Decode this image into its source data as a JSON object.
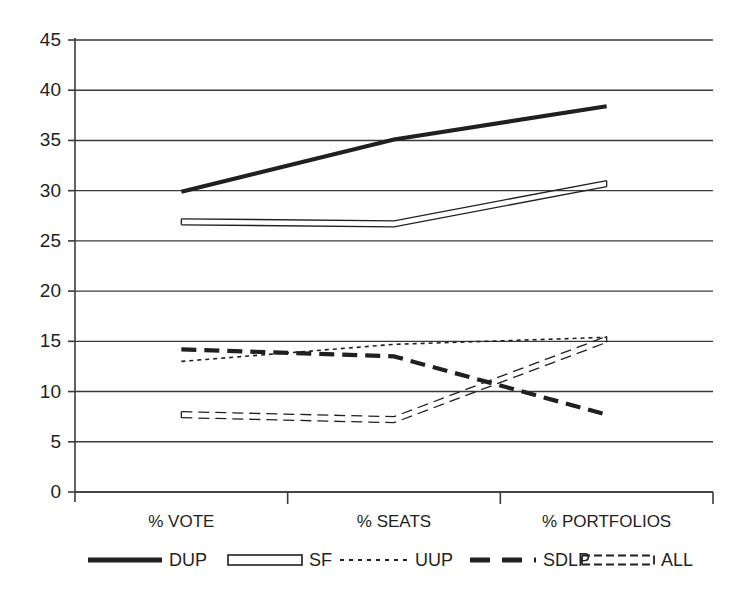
{
  "chart_data": {
    "type": "line",
    "title": "",
    "subtitle": "",
    "xlabel": "",
    "ylabel": "",
    "categories": [
      "% VOTE",
      "% SEATS",
      "% PORTFOLIOS"
    ],
    "ylim": [
      0,
      45
    ],
    "yticks": [
      0,
      5,
      10,
      15,
      20,
      25,
      30,
      35,
      40,
      45
    ],
    "ytick_labels": [
      "0",
      "5",
      "10",
      "15",
      "20",
      "25",
      "30",
      "35",
      "40",
      "45"
    ],
    "grid": "horizontal",
    "legend_position": "bottom",
    "series": [
      {
        "name": "DUP",
        "values": [
          29.9,
          35.1,
          38.4
        ],
        "style": "thick-solid",
        "color": "#231f20",
        "width": 4.2,
        "dash": "none"
      },
      {
        "name": "SF",
        "values": [
          26.9,
          26.7,
          30.7
        ],
        "style": "double-solid",
        "color": "#231f20",
        "width": 1.3,
        "dash": "none"
      },
      {
        "name": "UUP",
        "values": [
          13.0,
          14.7,
          15.4
        ],
        "style": "fine-dotted",
        "color": "#231f20",
        "width": 1.6,
        "dash": "4,4"
      },
      {
        "name": "SDLP",
        "values": [
          14.2,
          13.5,
          7.7
        ],
        "style": "thick-dashed",
        "color": "#231f20",
        "width": 4.2,
        "dash": "15,8"
      },
      {
        "name": "ALL",
        "values": [
          7.7,
          7.2,
          15.2
        ],
        "style": "double-dashed",
        "color": "#231f20",
        "width": 1.3,
        "dash": "11,6"
      }
    ]
  },
  "axes": {
    "y_ticks": [
      {
        "label": "45",
        "value": 45
      },
      {
        "label": "40",
        "value": 40
      },
      {
        "label": "35",
        "value": 35
      },
      {
        "label": "30",
        "value": 30
      },
      {
        "label": "25",
        "value": 25
      },
      {
        "label": "20",
        "value": 20
      },
      {
        "label": "15",
        "value": 15
      },
      {
        "label": "10",
        "value": 10
      },
      {
        "label": "5",
        "value": 5
      },
      {
        "label": "0",
        "value": 0
      }
    ],
    "x_ticks": [
      {
        "label": "% VOTE"
      },
      {
        "label": "% SEATS"
      },
      {
        "label": "% PORTFOLIOS"
      }
    ]
  },
  "legend": {
    "items": [
      {
        "label": "DUP",
        "style": "thick-solid"
      },
      {
        "label": "SF",
        "style": "double-solid"
      },
      {
        "label": "UUP",
        "style": "fine-dotted"
      },
      {
        "label": "SDLP",
        "style": "thick-dashed"
      },
      {
        "label": "ALL",
        "style": "double-dashed"
      }
    ]
  },
  "colors": {
    "ink": "#231f20",
    "grid": "#3a3a3a",
    "axis": "#3a3a3a",
    "background": "#ffffff"
  }
}
